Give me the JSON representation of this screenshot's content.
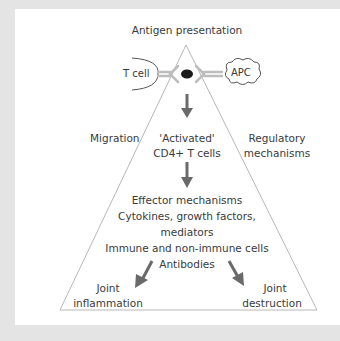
{
  "title": "Antigen presentation",
  "cells": {
    "t_cell": "T cell",
    "apc": "APC"
  },
  "side_labels": {
    "left": "Migration",
    "right_line1": "Regulatory",
    "right_line2": "mechanisms"
  },
  "activated": {
    "line1": "'Activated'",
    "line2": "CD4+  T cells"
  },
  "effector": {
    "lines": [
      "Effector mechanisms",
      "Cytokines, growth factors,",
      "mediators",
      "Immune and non-immune cells",
      "Antibodies"
    ]
  },
  "outcomes": {
    "left_line1": "Joint",
    "left_line2": "inflammation",
    "right_line1": "Joint",
    "right_line2": "destruction"
  },
  "colors": {
    "frame": "#e4e4e4",
    "triangle_stroke": "#b8b8b8",
    "arrow": "#6a6a6a",
    "receptor": "#bdbdbd",
    "antigen": "#1a1a1a",
    "text": "#3a3a3a"
  }
}
